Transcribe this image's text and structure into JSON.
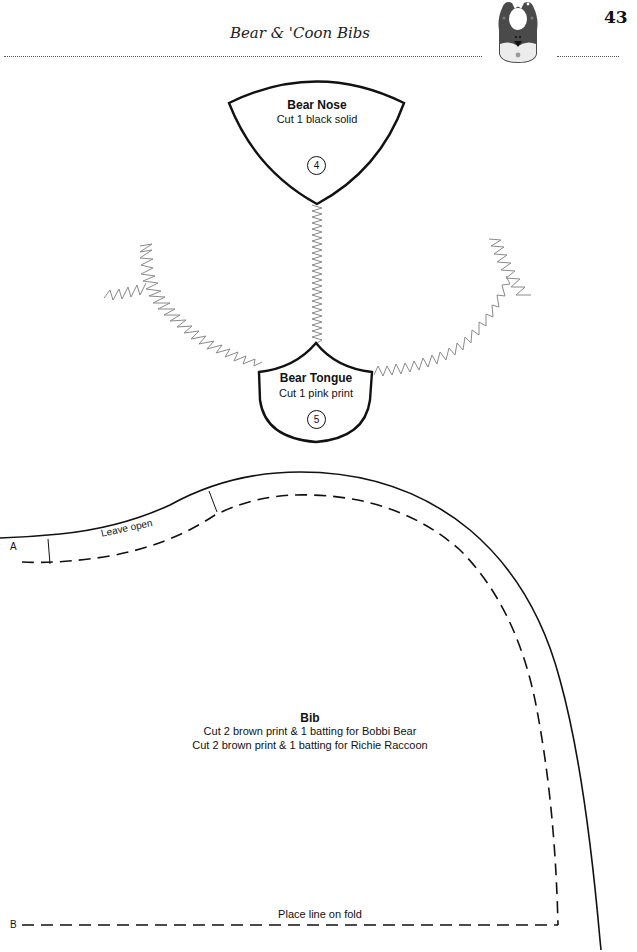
{
  "header": {
    "title": "Bear & 'Coon Bibs",
    "page_number": "43",
    "icon": "bear-bib-icon"
  },
  "pieces": {
    "nose": {
      "title": "Bear Nose",
      "instruction": "Cut 1 black solid",
      "number": "4"
    },
    "tongue": {
      "title": "Bear Tongue",
      "instruction": "Cut 1 pink print",
      "number": "5"
    },
    "bib": {
      "title": "Bib",
      "instructions": [
        "Cut 2 brown print & 1 batting for Bobbi Bear",
        "Cut 2 brown print & 1 batting for Richie Raccoon"
      ],
      "opening_label": "Leave open",
      "fold_label": "Place line on fold",
      "marker_a": "A",
      "marker_b": "B"
    }
  },
  "colors": {
    "line": "#111111",
    "zigzag": "#8a8a8a",
    "icon_dark": "#4a4a4a",
    "icon_light": "#ececec"
  }
}
